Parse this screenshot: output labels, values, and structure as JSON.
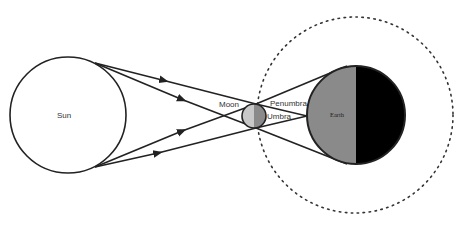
{
  "diagram": {
    "labels": {
      "sun": "Sun",
      "moon": "Moon",
      "earth": "Earth",
      "penumbra": "Penumbra",
      "umbra": "Umbra"
    },
    "colors": {
      "stroke": "#222222",
      "earth_lit": "#8a8a8a",
      "earth_dark": "#000000",
      "moon_lit": "#c8c8c8",
      "moon_dark": "#8a8a8a",
      "background": "#ffffff"
    },
    "bodies": {
      "sun": {
        "cx": 68,
        "cy": 115,
        "r": 58
      },
      "moon": {
        "cx": 254,
        "cy": 116,
        "r": 12
      },
      "earth": {
        "cx": 356,
        "cy": 115,
        "r": 49
      },
      "moon_orbit": {
        "cx": 355,
        "cy": 115,
        "r": 98,
        "style": "dotted"
      }
    },
    "rays": [
      {
        "from": "sun-top",
        "to": "moon-top",
        "continues_to": "earth-bottom"
      },
      {
        "from": "sun-top",
        "to": "moon-bottom",
        "continues_to": "earth-left"
      },
      {
        "from": "sun-bottom",
        "to": "moon-top",
        "continues_to": "earth-left"
      },
      {
        "from": "sun-bottom",
        "to": "moon-bottom",
        "continues_to": "earth-top"
      }
    ]
  }
}
